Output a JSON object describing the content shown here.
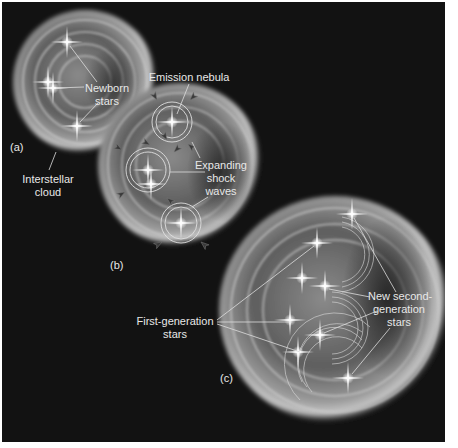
{
  "figure": {
    "background": "#121212",
    "panels": [
      {
        "id": "a",
        "letter": "(a)",
        "cloud": {
          "cx": 83,
          "cy": 80,
          "r": 70
        },
        "labels": {
          "newborn_stars": [
            "Newborn",
            "stars"
          ],
          "interstellar_cloud": [
            "Interstellar",
            "cloud"
          ]
        },
        "stars": [
          [
            65,
            40
          ],
          [
            46,
            80
          ],
          [
            51,
            86
          ],
          [
            75,
            124
          ]
        ]
      },
      {
        "id": "b",
        "letter": "(b)",
        "cloud": {
          "cx": 178,
          "cy": 163,
          "r": 80
        },
        "labels": {
          "emission_nebula": [
            "Emission nebula"
          ],
          "expanding_shock_waves": [
            "Expanding",
            "shock",
            "waves"
          ]
        },
        "nebulae": [
          [
            170,
            120,
            20
          ],
          [
            146,
            168,
            22
          ],
          [
            179,
            221,
            20
          ]
        ]
      },
      {
        "id": "c",
        "letter": "(c)",
        "cloud": {
          "cx": 333,
          "cy": 308,
          "r": 113
        },
        "labels": {
          "first_generation_stars": [
            "First-generation",
            "stars"
          ],
          "new_second_generation_stars": [
            "New second-",
            "generation",
            "stars"
          ]
        },
        "stars": [
          [
            350,
            212
          ],
          [
            315,
            241
          ],
          [
            300,
            276
          ],
          [
            323,
            284
          ],
          [
            288,
            318
          ],
          [
            318,
            333
          ],
          [
            296,
            350
          ],
          [
            346,
            376
          ]
        ]
      }
    ],
    "text": {
      "panel_a": "(a)",
      "panel_b": "(b)",
      "panel_c": "(c)",
      "newborn_line1": "Newborn",
      "newborn_line2": "stars",
      "interstellar_line1": "Interstellar",
      "interstellar_line2": "cloud",
      "emission_nebula": "Emission nebula",
      "expanding_line1": "Expanding",
      "expanding_line2": "shock",
      "expanding_line3": "waves",
      "first_gen_line1": "First-generation",
      "first_gen_line2": "stars",
      "second_gen_line1": "New second-",
      "second_gen_line2": "generation",
      "second_gen_line3": "stars"
    }
  }
}
